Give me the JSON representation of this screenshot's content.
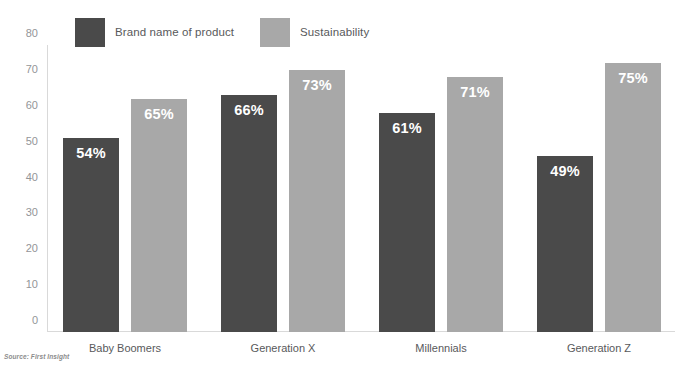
{
  "chart_data": {
    "type": "bar",
    "title": "",
    "xlabel": "",
    "ylabel": "",
    "ylim": [
      0,
      80
    ],
    "yticks": [
      80,
      70,
      60,
      50,
      40,
      30,
      20,
      10,
      0
    ],
    "grid": false,
    "legend_position": "top-left",
    "categories": [
      "Baby Boomers",
      "Generation X",
      "Millennials",
      "Generation Z"
    ],
    "series": [
      {
        "name": "Brand name of product",
        "color": "#4a4a4a",
        "values": [
          54,
          66,
          61,
          49
        ],
        "labels": [
          "54%",
          "66%",
          "61%",
          "49%"
        ]
      },
      {
        "name": "Sustainability",
        "color": "#a8a8a8",
        "values": [
          65,
          73,
          71,
          75
        ],
        "labels": [
          "65%",
          "73%",
          "71%",
          "75%"
        ]
      }
    ]
  },
  "legend": {
    "items": [
      {
        "label": "Brand name of product",
        "color": "#4a4a4a"
      },
      {
        "label": "Sustainability",
        "color": "#a8a8a8"
      }
    ]
  },
  "footer": {
    "source": "Source: First Insight"
  },
  "colors": {
    "series_dark": "#4a4a4a",
    "series_light": "#a8a8a8",
    "axis": "#d9d9d9",
    "tick_text": "#939598",
    "category_text": "#58595b",
    "value_text": "#ffffff",
    "background": "#ffffff"
  }
}
